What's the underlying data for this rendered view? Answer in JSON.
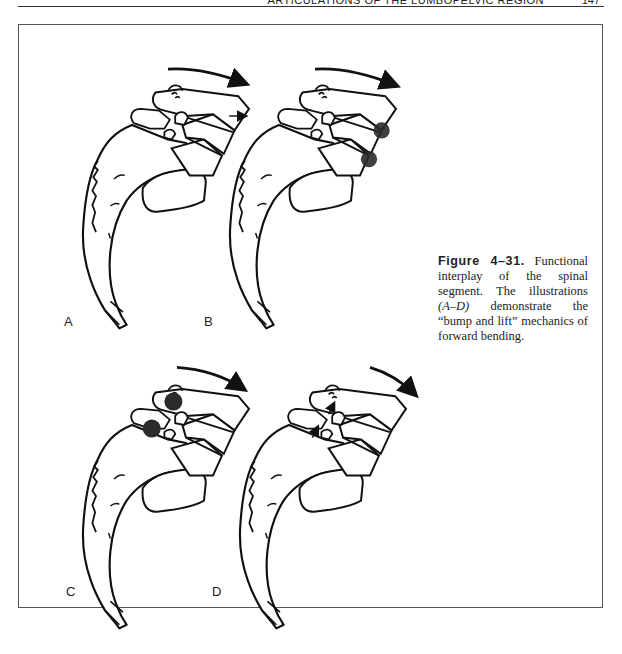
{
  "running_head": {
    "title": "Articulations of the Lumbopelvic Region",
    "page_number": "147"
  },
  "figure": {
    "number_label": "Figure 4–31.",
    "caption_part1": " Functional interplay of the spinal segment. The illustrations ",
    "caption_italic": "(A–D)",
    "caption_part2": " demonstrate the “bump and lift” mechanics of forward bending.",
    "panels": [
      {
        "id": "A",
        "label": "A",
        "description": "Lumbar segment with forward-bending arrow; small arrow showing anterior translation of upper vertebral body"
      },
      {
        "id": "B",
        "label": "B",
        "description": "Forward-bending arrow; shaded contact points at anterior disc margins"
      },
      {
        "id": "C",
        "label": "C",
        "description": "Forward-bending arrow; shaded contact points at facet joints (bump)"
      },
      {
        "id": "D",
        "label": "D",
        "description": "Forward-bending arrow; small upward arrows at facets indicating lift"
      }
    ],
    "colors": {
      "line": "#111111",
      "contact_shading": "#2b2b2b",
      "border": "#555555"
    }
  }
}
